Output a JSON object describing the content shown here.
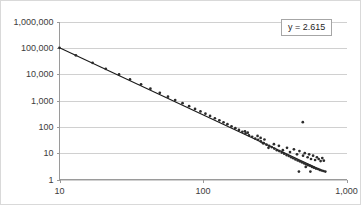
{
  "chart_data": {
    "type": "scatter",
    "title": "",
    "subtitle": "",
    "xlabel": "",
    "ylabel": "",
    "xscale": "log",
    "yscale": "log",
    "xlim": [
      10,
      1000
    ],
    "ylim": [
      1,
      1000000
    ],
    "grid": true,
    "grid_axis": "y",
    "legend_position": "top-right",
    "legend_entries": [
      "y = 2.615"
    ],
    "annotations": [
      "y = 2.615"
    ],
    "x_tick_labels": [
      "10",
      "100",
      "1,000"
    ],
    "x_tick_values": [
      10,
      100,
      1000
    ],
    "y_tick_labels": [
      "1",
      "10",
      "100",
      "1,000",
      "10,000",
      "100,000",
      "1,000,000"
    ],
    "y_tick_values": [
      1,
      10,
      100,
      1000,
      10000,
      100000,
      1000000
    ],
    "series": [
      {
        "name": "observations",
        "type": "scatter",
        "marker": "circle",
        "color": "#2b2b2b",
        "points": [
          [
            10,
            100000
          ],
          [
            13,
            52000
          ],
          [
            17,
            27000
          ],
          [
            21,
            16000
          ],
          [
            26,
            9800
          ],
          [
            31,
            6300
          ],
          [
            37,
            4100
          ],
          [
            43,
            2800
          ],
          [
            50,
            1950
          ],
          [
            57,
            1400
          ],
          [
            64,
            1040
          ],
          [
            72,
            790
          ],
          [
            80,
            610
          ],
          [
            88,
            480
          ],
          [
            96,
            385
          ],
          [
            104,
            315
          ],
          [
            112,
            260
          ],
          [
            121,
            212
          ],
          [
            130,
            176
          ],
          [
            139,
            148
          ],
          [
            148,
            126
          ],
          [
            158,
            105
          ],
          [
            168,
            89
          ],
          [
            178,
            76
          ],
          [
            188,
            65
          ],
          [
            198,
            56
          ],
          [
            209,
            48
          ],
          [
            220,
            42
          ],
          [
            231,
            36
          ],
          [
            242,
            32
          ],
          [
            253,
            28
          ],
          [
            265,
            24
          ],
          [
            277,
            21
          ],
          [
            289,
            19
          ],
          [
            301,
            17
          ],
          [
            314,
            15
          ],
          [
            327,
            13
          ],
          [
            340,
            12
          ],
          [
            354,
            10.5
          ],
          [
            368,
            9.5
          ],
          [
            382,
            8.5
          ],
          [
            396,
            7.8
          ],
          [
            411,
            7.0
          ],
          [
            426,
            6.4
          ],
          [
            441,
            5.8
          ],
          [
            457,
            5.3
          ],
          [
            473,
            4.9
          ],
          [
            489,
            4.5
          ],
          [
            506,
            4.1
          ],
          [
            523,
            3.8
          ],
          [
            540,
            3.5
          ],
          [
            558,
            3.3
          ],
          [
            576,
            3.0
          ],
          [
            594,
            2.8
          ],
          [
            613,
            2.6
          ],
          [
            632,
            2.5
          ],
          [
            651,
            2.3
          ],
          [
            671,
            2.2
          ],
          [
            691,
            2.1
          ],
          [
            712,
            2.0
          ],
          [
            262,
            24
          ],
          [
            286,
            16
          ],
          [
            312,
            22
          ],
          [
            338,
            19
          ],
          [
            360,
            13
          ],
          [
            385,
            16
          ],
          [
            404,
            11
          ],
          [
            430,
            14
          ],
          [
            452,
            9
          ],
          [
            470,
            12
          ],
          [
            498,
            8
          ],
          [
            512,
            10
          ],
          [
            536,
            7
          ],
          [
            549,
            9
          ],
          [
            566,
            6
          ],
          [
            585,
            8
          ],
          [
            604,
            5.5
          ],
          [
            622,
            7
          ],
          [
            640,
            6
          ],
          [
            660,
            5
          ],
          [
            678,
            6.5
          ],
          [
            695,
            5.2
          ],
          [
            496,
            150
          ],
          [
            466,
            2.0
          ],
          [
            560,
            2.0
          ],
          [
            520,
            3.0
          ],
          [
            240,
            45
          ],
          [
            252,
            38
          ],
          [
            268,
            33
          ],
          [
            205,
            60
          ],
          [
            196,
            68
          ]
        ]
      },
      {
        "name": "power-law fit",
        "type": "line",
        "color": "#1a1a1a",
        "slope": -2.615,
        "endpoints": [
          [
            10,
            100000
          ],
          [
            700,
            2.0
          ]
        ]
      }
    ]
  },
  "legend": {
    "label": "y = 2.615"
  }
}
